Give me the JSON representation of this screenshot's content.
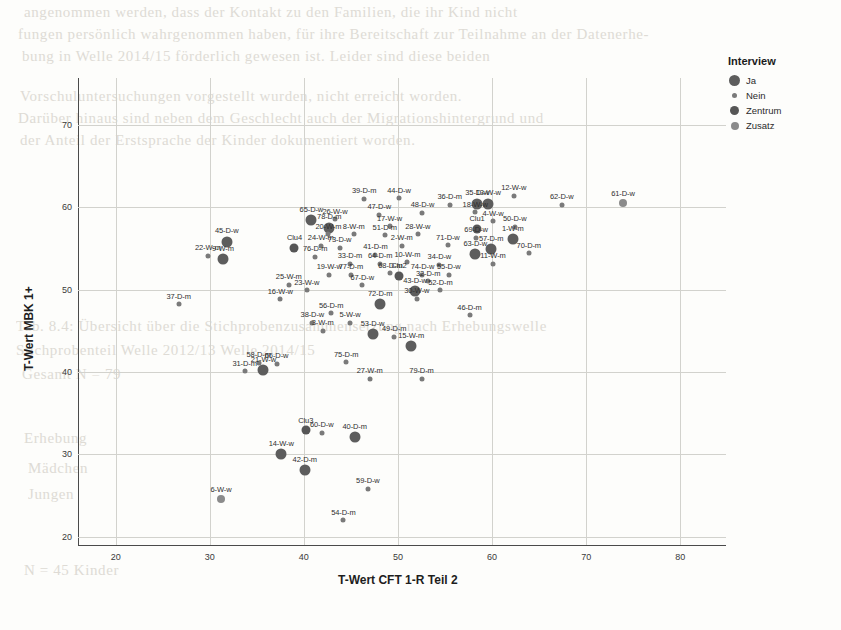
{
  "chart_data": {
    "type": "scatter",
    "title": "",
    "xlabel": "T-Wert CFT 1-R Teil 2",
    "ylabel": "T-Wert MBK 1+",
    "xlim": [
      16,
      84
    ],
    "ylim": [
      19,
      73
    ],
    "xticks": [
      20,
      30,
      40,
      50,
      60,
      70,
      80
    ],
    "yticks": [
      20,
      30,
      40,
      50,
      60,
      70
    ],
    "grid": true,
    "legend": {
      "title": "Interview",
      "position": "top-right",
      "entries": [
        {
          "label": "Ja",
          "size": 11,
          "color": "#5d5d5d"
        },
        {
          "label": "Nein",
          "size": 5,
          "color": "#7a7a7a"
        },
        {
          "label": "Zentrum",
          "size": 9,
          "color": "#565656"
        },
        {
          "label": "Zusatz",
          "size": 8,
          "color": "#8b8b8b"
        }
      ]
    },
    "points": [
      {
        "label": "39-D-m",
        "x": 46.4,
        "y": 61.0,
        "cat": "Nein"
      },
      {
        "label": "44-D-w",
        "x": 50.1,
        "y": 61.1,
        "cat": "Nein"
      },
      {
        "label": "36-D-m",
        "x": 55.5,
        "y": 60.3,
        "cat": "Nein"
      },
      {
        "label": "35-D-w",
        "x": 58.4,
        "y": 60.4,
        "cat": "Ja"
      },
      {
        "label": "13-W-w",
        "x": 59.6,
        "y": 60.4,
        "cat": "Ja"
      },
      {
        "label": "12-W-w",
        "x": 62.3,
        "y": 61.4,
        "cat": "Nein"
      },
      {
        "label": "62-D-w",
        "x": 67.4,
        "y": 60.3,
        "cat": "Nein"
      },
      {
        "label": "61-D-w",
        "x": 73.9,
        "y": 60.5,
        "cat": "Zusatz"
      },
      {
        "label": "18-W-w",
        "x": 58.2,
        "y": 59.4,
        "cat": "Nein"
      },
      {
        "label": "48-D-w",
        "x": 52.6,
        "y": 59.3,
        "cat": "Nein"
      },
      {
        "label": "47-D-w",
        "x": 48.0,
        "y": 59.1,
        "cat": "Nein"
      },
      {
        "label": "65-D-w",
        "x": 40.8,
        "y": 58.4,
        "cat": "Ja"
      },
      {
        "label": "26-W-w",
        "x": 43.3,
        "y": 58.5,
        "cat": "Nein"
      },
      {
        "label": "4-W-w",
        "x": 60.1,
        "y": 58.3,
        "cat": "Nein"
      },
      {
        "label": "78-D-m",
        "x": 42.7,
        "y": 57.5,
        "cat": "Ja"
      },
      {
        "label": "17-W-w",
        "x": 49.1,
        "y": 57.7,
        "cat": "Nein"
      },
      {
        "label": "Clu1",
        "x": 58.4,
        "y": 57.4,
        "cat": "Zentrum"
      },
      {
        "label": "50-D-w",
        "x": 62.4,
        "y": 57.6,
        "cat": "Nein"
      },
      {
        "label": "20-W-m",
        "x": 42.6,
        "y": 56.7,
        "cat": "Nein"
      },
      {
        "label": "8-W-m",
        "x": 45.3,
        "y": 56.7,
        "cat": "Nein"
      },
      {
        "label": "51-D-m",
        "x": 48.6,
        "y": 56.6,
        "cat": "Nein"
      },
      {
        "label": "28-W-w",
        "x": 52.1,
        "y": 56.7,
        "cat": "Nein"
      },
      {
        "label": "69-D-w",
        "x": 58.3,
        "y": 56.3,
        "cat": "Nein"
      },
      {
        "label": "1-W-m",
        "x": 62.2,
        "y": 56.1,
        "cat": "Ja"
      },
      {
        "label": "45-D-w",
        "x": 31.8,
        "y": 55.8,
        "cat": "Ja"
      },
      {
        "label": "Clu4",
        "x": 39.0,
        "y": 55.1,
        "cat": "Zentrum"
      },
      {
        "label": "24-W-m",
        "x": 41.8,
        "y": 55.3,
        "cat": "Nein"
      },
      {
        "label": "73-D-w",
        "x": 43.8,
        "y": 55.1,
        "cat": "Nein"
      },
      {
        "label": "2-W-m",
        "x": 50.4,
        "y": 55.3,
        "cat": "Nein"
      },
      {
        "label": "71-D-w",
        "x": 55.3,
        "y": 55.4,
        "cat": "Nein"
      },
      {
        "label": "22-W-m",
        "x": 29.8,
        "y": 54.1,
        "cat": "Nein"
      },
      {
        "label": "9-W-m",
        "x": 31.4,
        "y": 53.7,
        "cat": "Ja"
      },
      {
        "label": "76-D-m",
        "x": 41.2,
        "y": 54.0,
        "cat": "Nein"
      },
      {
        "label": "41-D-m",
        "x": 47.6,
        "y": 54.2,
        "cat": "Nein"
      },
      {
        "label": "63-D-w",
        "x": 58.2,
        "y": 54.3,
        "cat": "Ja"
      },
      {
        "label": "57-D-m",
        "x": 59.9,
        "y": 54.9,
        "cat": "Ja"
      },
      {
        "label": "70-D-m",
        "x": 63.9,
        "y": 54.4,
        "cat": "Nein"
      },
      {
        "label": "33-D-m",
        "x": 44.9,
        "y": 53.1,
        "cat": "Nein"
      },
      {
        "label": "64-D-m",
        "x": 48.1,
        "y": 53.1,
        "cat": "Nein"
      },
      {
        "label": "10-W-m",
        "x": 51.0,
        "y": 53.3,
        "cat": "Nein"
      },
      {
        "label": "34-D-w",
        "x": 54.4,
        "y": 53.0,
        "cat": "Nein"
      },
      {
        "label": "11-W-m",
        "x": 60.1,
        "y": 53.1,
        "cat": "Nein"
      },
      {
        "label": "19-W-w",
        "x": 42.7,
        "y": 51.8,
        "cat": "Nein"
      },
      {
        "label": "77-D-m",
        "x": 45.0,
        "y": 51.8,
        "cat": "Nein"
      },
      {
        "label": "68-D-m",
        "x": 49.2,
        "y": 52.0,
        "cat": "Nein"
      },
      {
        "label": "Clu2",
        "x": 50.1,
        "y": 51.7,
        "cat": "Zentrum"
      },
      {
        "label": "74-D-w",
        "x": 52.6,
        "y": 51.8,
        "cat": "Nein"
      },
      {
        "label": "55-D-w",
        "x": 55.4,
        "y": 51.8,
        "cat": "Nein"
      },
      {
        "label": "32-D-m",
        "x": 53.2,
        "y": 51.0,
        "cat": "Nein"
      },
      {
        "label": "25-W-m",
        "x": 38.4,
        "y": 50.6,
        "cat": "Nein"
      },
      {
        "label": "67-D-w",
        "x": 46.2,
        "y": 50.5,
        "cat": "Nein"
      },
      {
        "label": "23-W-w",
        "x": 40.3,
        "y": 49.9,
        "cat": "Nein"
      },
      {
        "label": "43-D-w",
        "x": 51.8,
        "y": 49.8,
        "cat": "Ja"
      },
      {
        "label": "52-D-m",
        "x": 54.5,
        "y": 49.9,
        "cat": "Nein"
      },
      {
        "label": "37-D-m",
        "x": 26.7,
        "y": 48.2,
        "cat": "Nein"
      },
      {
        "label": "16-W-w",
        "x": 37.5,
        "y": 48.8,
        "cat": "Nein"
      },
      {
        "label": "30-W-w",
        "x": 52.0,
        "y": 48.9,
        "cat": "Nein"
      },
      {
        "label": "72-D-m",
        "x": 48.1,
        "y": 48.2,
        "cat": "Ja"
      },
      {
        "label": "56-D-m",
        "x": 42.9,
        "y": 47.1,
        "cat": "Nein"
      },
      {
        "label": "46-D-m",
        "x": 57.6,
        "y": 46.9,
        "cat": "Nein"
      },
      {
        "label": "38-D-w",
        "x": 40.9,
        "y": 46.0,
        "cat": "Nein"
      },
      {
        "label": "5-W-w",
        "x": 44.9,
        "y": 46.0,
        "cat": "Nein"
      },
      {
        "label": "3-W-m",
        "x": 42.0,
        "y": 45.0,
        "cat": "Nein"
      },
      {
        "label": "53-D-w",
        "x": 47.3,
        "y": 44.6,
        "cat": "Ja"
      },
      {
        "label": "49-D-m",
        "x": 49.6,
        "y": 44.3,
        "cat": "Nein"
      },
      {
        "label": "15-W-m",
        "x": 51.4,
        "y": 43.1,
        "cat": "Ja"
      },
      {
        "label": "58-D-m",
        "x": 35.2,
        "y": 41.1,
        "cat": "Nein"
      },
      {
        "label": "66-D-w",
        "x": 37.1,
        "y": 41.0,
        "cat": "Nein"
      },
      {
        "label": "75-D-m",
        "x": 44.5,
        "y": 41.2,
        "cat": "Nein"
      },
      {
        "label": "31-D-m",
        "x": 33.7,
        "y": 40.1,
        "cat": "Nein"
      },
      {
        "label": "21-W-w",
        "x": 35.7,
        "y": 40.2,
        "cat": "Ja"
      },
      {
        "label": "27-W-m",
        "x": 47.0,
        "y": 39.2,
        "cat": "Nein"
      },
      {
        "label": "79-D-m",
        "x": 52.5,
        "y": 39.2,
        "cat": "Nein"
      },
      {
        "label": "Clu3",
        "x": 40.2,
        "y": 32.9,
        "cat": "Zentrum"
      },
      {
        "label": "60-D-w",
        "x": 41.9,
        "y": 32.6,
        "cat": "Nein"
      },
      {
        "label": "40-D-m",
        "x": 45.4,
        "y": 32.1,
        "cat": "Ja"
      },
      {
        "label": "14-W-w",
        "x": 37.6,
        "y": 30.0,
        "cat": "Ja"
      },
      {
        "label": "42-D-m",
        "x": 40.1,
        "y": 28.1,
        "cat": "Ja"
      },
      {
        "label": "59-D-w",
        "x": 46.8,
        "y": 25.8,
        "cat": "Nein"
      },
      {
        "label": "6-W-w",
        "x": 31.2,
        "y": 24.6,
        "cat": "Zusatz"
      },
      {
        "label": "54-D-m",
        "x": 44.2,
        "y": 22.0,
        "cat": "Nein"
      }
    ]
  },
  "bleed_lines": [
    {
      "t": "angenommen werden, dass der Kontakt zu den Familien, die ihr Kind nicht",
      "x": 24,
      "y": 4
    },
    {
      "t": "fungen persönlich wahrgenommen haben, für ihre Bereitschaft zur Teilnahme an der Datenerhe-",
      "x": 18,
      "y": 26
    },
    {
      "t": "bung in Welle 2014/15 förderlich gewesen ist. Leider sind diese beiden",
      "x": 22,
      "y": 48
    },
    {
      "t": "Vorschuluntersuchungen vorgestellt wurden, nicht erreicht worden.",
      "x": 20,
      "y": 88
    },
    {
      "t": "Darüber hinaus sind neben dem Geschlecht auch der Migrationshintergrund und",
      "x": 18,
      "y": 110
    },
    {
      "t": "der Anteil der Erstsprache der Kinder dokumentiert worden.",
      "x": 20,
      "y": 132
    },
    {
      "t": "Tab. 8.4: Übersicht über die Stichprobenzusammensetzung nach Erhebungswelle",
      "x": 16,
      "y": 318
    },
    {
      "t": "Stichprobenteil            Welle 2012/13        Welle 2014/15",
      "x": 16,
      "y": 342
    },
    {
      "t": "Gesamt         N = 79",
      "x": 22,
      "y": 366
    },
    {
      "t": "Erhebung",
      "x": 24,
      "y": 430
    },
    {
      "t": "Mädchen",
      "x": 28,
      "y": 460
    },
    {
      "t": "Jungen",
      "x": 28,
      "y": 486
    },
    {
      "t": "N = 45 Kinder",
      "x": 24,
      "y": 562
    }
  ]
}
